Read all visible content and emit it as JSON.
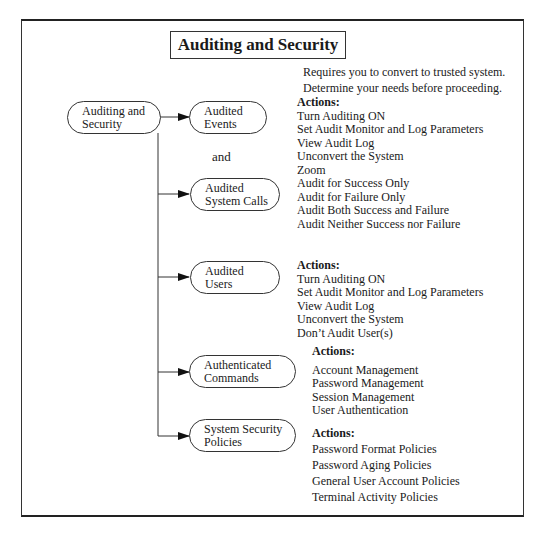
{
  "title": "Auditing and Security",
  "note": [
    "Requires you to convert to trusted system.",
    "Determine your needs before proceeding."
  ],
  "root": {
    "line1": "Auditing and",
    "line2": "Security"
  },
  "connector_word": "and",
  "nodes": [
    {
      "line1": "Audited",
      "line2": "Events"
    },
    {
      "line1": "Audited",
      "line2": "System Calls"
    },
    {
      "line1": "Audited",
      "line2": "Users"
    },
    {
      "line1": "Authenticated",
      "line2": "Commands"
    },
    {
      "line1": "System Security",
      "line2": "Policies"
    }
  ],
  "action_blocks": [
    {
      "heading": "Actions:",
      "items": [
        "Turn Auditing ON",
        "Set Audit Monitor and Log Parameters",
        "View Audit Log",
        "Unconvert the System",
        "Zoom",
        "Audit for Success Only",
        "Audit for Failure Only",
        "Audit Both Success and Failure",
        "Audit Neither Success nor Failure"
      ]
    },
    {
      "heading": "Actions:",
      "items": [
        "Turn Auditing ON",
        "Set Audit Monitor and Log Parameters",
        "View Audit Log",
        "Unconvert the System",
        "Don’t Audit User(s)"
      ]
    },
    {
      "heading": "Actions:",
      "items": [
        "Account Management",
        "Password Management",
        "Session Management",
        "User Authentication"
      ]
    },
    {
      "heading": "Actions:",
      "items": [
        "Password Format Policies",
        "Password Aging Policies",
        "General User Account Policies",
        "Terminal Activity Policies"
      ]
    }
  ]
}
